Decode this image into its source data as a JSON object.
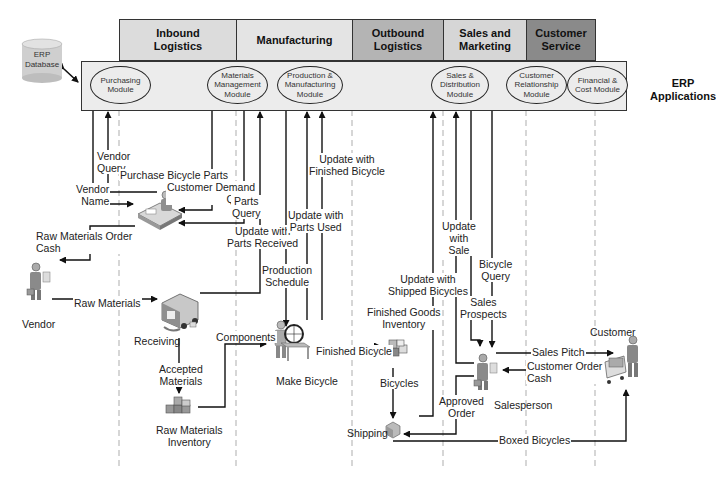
{
  "value_chain": {
    "activities": [
      {
        "label": "Inbound\nLogistics",
        "line1": "Inbound",
        "line2": "Logistics",
        "color": "#dcdcdc"
      },
      {
        "label": "Manufacturing",
        "line1": "Manufacturing",
        "line2": "",
        "color": "#e4e4e4"
      },
      {
        "label": "Outbound\nLogistics",
        "line1": "Outbound",
        "line2": "Logistics",
        "color": "#b4b4b4"
      },
      {
        "label": "Sales and\nMarketing",
        "line1": "Sales and",
        "line2": "Marketing",
        "color": "#d6d6d6"
      },
      {
        "label": "Customer\nService",
        "line1": "Customer",
        "line2": "Service",
        "color": "#8a8a8a"
      }
    ]
  },
  "erp": {
    "database": {
      "line1": "ERP",
      "line2": "Database"
    },
    "applications_label": {
      "line1": "ERP",
      "line2": "Applications"
    },
    "modules": [
      {
        "line1": "Purchasing",
        "line2": "Module",
        "line3": ""
      },
      {
        "line1": "Materials",
        "line2": "Management",
        "line3": "Module"
      },
      {
        "line1": "Production &",
        "line2": "Manufacturing",
        "line3": "Module"
      },
      {
        "line1": "Sales &",
        "line2": "Distribution",
        "line3": "Module"
      },
      {
        "line1": "Customer",
        "line2": "Relationship",
        "line3": "Module"
      },
      {
        "line1": "Financial &",
        "line2": "Cost Module",
        "line3": ""
      }
    ]
  },
  "actors": {
    "vendor": "Vendor",
    "receiving": "Receiving",
    "raw_materials_inventory": {
      "line1": "Raw Materials",
      "line2": "Inventory"
    },
    "make_bicycle": "Make Bicycle",
    "finished_goods_inventory": {
      "line1": "Finished Goods",
      "line2": "Inventory"
    },
    "bicycles": "Bicycles",
    "shipping": "Shipping",
    "salesperson": "Salesperson",
    "customer": "Customer"
  },
  "flows": {
    "vendor_query": {
      "line1": "Vendor",
      "line2": "Query"
    },
    "vendor_name": {
      "line1": "Vendor",
      "line2": "Name"
    },
    "purchase_bicycle_parts": "Purchase Bicycle Parts",
    "customer_demand_query": {
      "line1": "Customer Demand",
      "line2": "Query"
    },
    "parts_query": {
      "line1": "Parts",
      "line2": "Query"
    },
    "update_parts_received": {
      "line1": "Update with",
      "line2": "Parts Received"
    },
    "raw_materials_order_cash": {
      "line1": "Raw Materials Order",
      "line2": "Cash"
    },
    "raw_materials": "Raw Materials",
    "production_schedule": {
      "line1": "Production",
      "line2": "Schedule"
    },
    "update_parts_used": {
      "line1": "Update with",
      "line2": "Parts Used"
    },
    "update_finished_bicycle": {
      "line1": "Update with",
      "line2": "Finished Bicycle"
    },
    "accepted_materials": {
      "line1": "Accepted",
      "line2": "Materials"
    },
    "components": "Components",
    "finished_bicycle": "Finished Bicycle",
    "update_shipped_bicycles": {
      "line1": "Update with",
      "line2": "Shipped Bicycles"
    },
    "update_with_sale": {
      "line1": "Update",
      "line2": "with",
      "line3": "Sale"
    },
    "bicycle_query": {
      "line1": "Bicycle",
      "line2": "Query"
    },
    "sales_prospects": {
      "line1": "Sales",
      "line2": "Prospects"
    },
    "sales_pitch": "Sales Pitch",
    "customer_order_cash": {
      "line1": "Customer Order",
      "line2": "Cash"
    },
    "approved_order": {
      "line1": "Approved",
      "line2": "Order"
    },
    "boxed_bicycles": "Boxed Bicycles"
  }
}
